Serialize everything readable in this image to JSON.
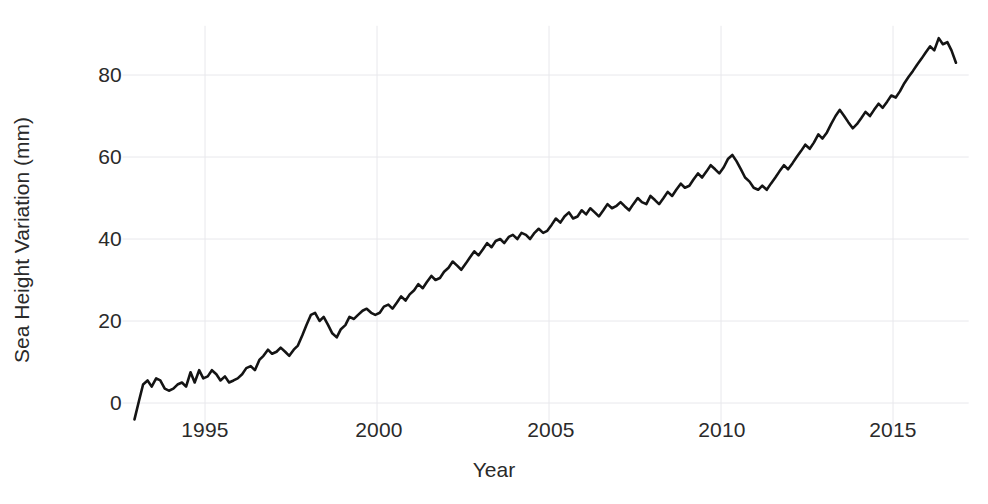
{
  "figure": {
    "width": 988,
    "height": 504,
    "background_color": "#ffffff"
  },
  "axes": {
    "x_title": "Year",
    "y_title": "Sea Height Variation (mm)",
    "x_tick_labels": [
      "1995",
      "2000",
      "2005",
      "2010",
      "2015"
    ],
    "y_tick_labels": [
      "0",
      "20",
      "40",
      "60",
      "80"
    ]
  },
  "chart_data": {
    "type": "line",
    "title": "",
    "subtitle": "",
    "xlabel": "Year",
    "ylabel": "Sea Height Variation (mm)",
    "xlim": [
      1992.8,
      1993.0
    ],
    "x_range": [
      1992.9,
      1016.7
    ],
    "ylim": [
      -6,
      92
    ],
    "xticks": [
      1995,
      2000,
      2005,
      2010,
      2015
    ],
    "yticks": [
      0,
      20,
      40,
      60,
      80
    ],
    "grid": true,
    "grid_color": "#e8e8ec",
    "legend": null,
    "legend_position": "none",
    "line_color": "#141414",
    "line_width": 2.6,
    "annotations": [],
    "series": [
      {
        "name": "Global mean sea level",
        "units": "mm",
        "x": [
          1992.95,
          1993.08,
          1993.2,
          1993.33,
          1993.45,
          1993.58,
          1993.7,
          1993.83,
          1993.95,
          1994.08,
          1994.2,
          1994.33,
          1994.45,
          1994.58,
          1994.7,
          1994.83,
          1994.95,
          1995.08,
          1995.2,
          1995.33,
          1995.45,
          1995.58,
          1995.7,
          1995.83,
          1995.95,
          1996.08,
          1996.2,
          1996.33,
          1996.45,
          1996.58,
          1996.7,
          1996.83,
          1996.95,
          1997.08,
          1997.2,
          1997.33,
          1997.45,
          1997.58,
          1997.7,
          1997.83,
          1997.95,
          1998.08,
          1998.2,
          1998.33,
          1998.45,
          1998.58,
          1998.7,
          1998.83,
          1998.95,
          1999.08,
          1999.2,
          1999.33,
          1999.45,
          1999.58,
          1999.7,
          1999.83,
          1999.95,
          2000.08,
          2000.2,
          2000.33,
          2000.45,
          2000.58,
          2000.7,
          2000.83,
          2000.95,
          2001.08,
          2001.2,
          2001.33,
          2001.45,
          2001.58,
          2001.7,
          2001.83,
          2001.95,
          2002.08,
          2002.2,
          2002.33,
          2002.45,
          2002.58,
          2002.7,
          2002.83,
          2002.95,
          2003.08,
          2003.2,
          2003.33,
          2003.45,
          2003.58,
          2003.7,
          2003.83,
          2003.95,
          2004.08,
          2004.2,
          2004.33,
          2004.45,
          2004.58,
          2004.7,
          2004.83,
          2004.95,
          2005.08,
          2005.2,
          2005.33,
          2005.45,
          2005.58,
          2005.7,
          2005.83,
          2005.95,
          2006.08,
          2006.2,
          2006.33,
          2006.45,
          2006.58,
          2006.7,
          2006.83,
          2006.95,
          2007.08,
          2007.2,
          2007.33,
          2007.45,
          2007.58,
          2007.7,
          2007.83,
          2007.95,
          2008.08,
          2008.2,
          2008.33,
          2008.45,
          2008.58,
          2008.7,
          2008.83,
          2008.95,
          2009.08,
          2009.2,
          2009.33,
          2009.45,
          2009.58,
          2009.7,
          2009.83,
          2009.95,
          2010.08,
          2010.2,
          2010.33,
          2010.45,
          2010.58,
          2010.7,
          2010.83,
          2010.95,
          2011.08,
          2011.2,
          2011.33,
          2011.45,
          2011.58,
          2011.7,
          2011.83,
          2011.95,
          2012.08,
          2012.2,
          2012.33,
          2012.45,
          2012.58,
          2012.7,
          2012.83,
          2012.95,
          2013.08,
          2013.2,
          2013.33,
          2013.45,
          2013.58,
          2013.7,
          2013.83,
          2013.95,
          2014.08,
          2014.2,
          2014.33,
          2014.45,
          2014.58,
          2014.7,
          2014.83,
          2014.95,
          2015.08,
          2015.2,
          2015.33,
          2015.45,
          2015.58,
          2015.7,
          2015.83,
          2015.95,
          2016.08,
          2016.2,
          2016.33,
          2016.45,
          2016.58,
          2016.7,
          2016.83
        ],
        "values": [
          -4.0,
          0.5,
          4.5,
          5.5,
          4.0,
          6.0,
          5.5,
          3.5,
          3.0,
          3.5,
          4.5,
          5.0,
          4.0,
          7.5,
          5.0,
          8.0,
          6.0,
          6.5,
          8.0,
          7.0,
          5.5,
          6.5,
          5.0,
          5.5,
          6.0,
          7.0,
          8.5,
          9.0,
          8.0,
          10.5,
          11.5,
          13.0,
          12.0,
          12.5,
          13.5,
          12.5,
          11.5,
          13.0,
          14.0,
          16.5,
          19.0,
          21.5,
          22.0,
          20.0,
          21.0,
          19.0,
          17.0,
          16.0,
          18.0,
          19.0,
          21.0,
          20.5,
          21.5,
          22.5,
          23.0,
          22.0,
          21.5,
          22.0,
          23.5,
          24.0,
          23.0,
          24.5,
          26.0,
          25.0,
          26.5,
          27.5,
          29.0,
          28.0,
          29.5,
          31.0,
          30.0,
          30.5,
          32.0,
          33.0,
          34.5,
          33.5,
          32.5,
          34.0,
          35.5,
          37.0,
          36.0,
          37.5,
          39.0,
          38.0,
          39.5,
          40.0,
          39.0,
          40.5,
          41.0,
          40.0,
          41.5,
          41.0,
          40.0,
          41.5,
          42.5,
          41.5,
          42.0,
          43.5,
          45.0,
          44.0,
          45.5,
          46.5,
          45.0,
          45.5,
          47.0,
          46.0,
          47.5,
          46.5,
          45.5,
          47.0,
          48.5,
          47.5,
          48.0,
          49.0,
          48.0,
          47.0,
          48.5,
          50.0,
          49.0,
          48.5,
          50.5,
          49.5,
          48.5,
          50.0,
          51.5,
          50.5,
          52.0,
          53.5,
          52.5,
          53.0,
          54.5,
          56.0,
          55.0,
          56.5,
          58.0,
          57.0,
          56.0,
          57.5,
          59.5,
          60.5,
          59.0,
          57.0,
          55.0,
          54.0,
          52.5,
          52.0,
          53.0,
          52.0,
          53.5,
          55.0,
          56.5,
          58.0,
          57.0,
          58.5,
          60.0,
          61.5,
          63.0,
          62.0,
          63.5,
          65.5,
          64.5,
          66.0,
          68.0,
          70.0,
          71.5,
          70.0,
          68.5,
          67.0,
          68.0,
          69.5,
          71.0,
          70.0,
          71.5,
          73.0,
          72.0,
          73.5,
          75.0,
          74.5,
          76.0,
          78.0,
          79.5,
          81.0,
          82.5,
          84.0,
          85.5,
          87.0,
          86.0,
          89.0,
          87.5,
          88.0,
          86.0,
          83.0
        ]
      }
    ]
  }
}
